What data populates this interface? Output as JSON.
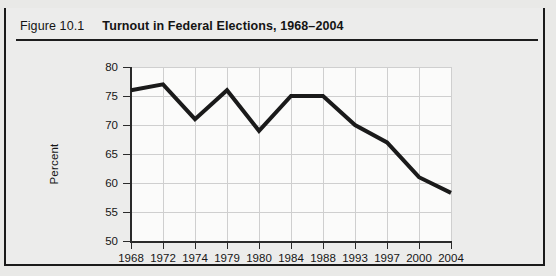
{
  "figure": {
    "number_label": "Figure 10.1",
    "title": "Turnout in Federal Elections, 1968–2004"
  },
  "chart_data": {
    "type": "line",
    "title": "Turnout in Federal Elections, 1968–2004",
    "xlabel": "",
    "ylabel": "Percent",
    "categories": [
      "1968",
      "1972",
      "1974",
      "1979",
      "1980",
      "1984",
      "1988",
      "1993",
      "1997",
      "2000",
      "2004"
    ],
    "values": [
      76.0,
      77.0,
      71.0,
      76.0,
      69.0,
      75.0,
      75.0,
      70.0,
      67.0,
      61.0,
      58.3
    ],
    "ylim": [
      50,
      80
    ],
    "yticks": [
      50,
      55,
      60,
      65,
      70,
      75,
      80
    ],
    "ytick_labels": [
      "50",
      "55",
      "60",
      "65",
      "70",
      "75",
      "80"
    ],
    "grid": true,
    "legend": "none",
    "line_color": "#1a1a1a",
    "line_width": 4
  },
  "colors": {
    "page_background": "#e9e9e7",
    "figure_background": "#ececeb",
    "plot_background": "#fbfbfa",
    "border": "#1a1a1a",
    "gridline": "#cfcfcf",
    "text": "#141414"
  }
}
